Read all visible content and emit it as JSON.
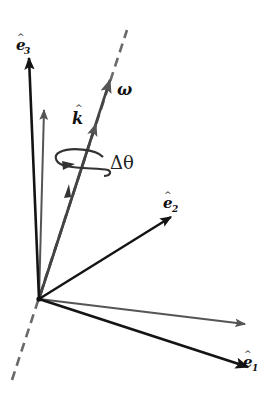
{
  "diagram": {
    "title": "",
    "colors": {
      "background": "#ffffff",
      "basis_vector": "#141414",
      "rotated_vector": "#555555",
      "axis": "#666666"
    },
    "origin": [
      39,
      299
    ],
    "rotation_axis": {
      "style": "dashed",
      "from": [
        12,
        380
      ],
      "to": [
        127,
        30
      ]
    },
    "vectors": [
      {
        "id": "e1",
        "label_base": "e",
        "label_sub": "1",
        "tip": [
          251,
          368
        ],
        "color": "basis",
        "label_pos": [
          250,
          360
        ]
      },
      {
        "id": "e2",
        "label_base": "e",
        "label_sub": "2",
        "tip": [
          173,
          216
        ],
        "color": "basis",
        "label_pos": [
          165,
          200
        ]
      },
      {
        "id": "e3",
        "label_base": "e",
        "label_sub": "3",
        "tip": [
          29,
          55
        ],
        "color": "basis",
        "label_pos": [
          19,
          47
        ]
      },
      {
        "id": "e1-rotated",
        "tip": [
          247,
          324
        ],
        "color": "rotated"
      },
      {
        "id": "e3-rotated",
        "tip": [
          44,
          108
        ],
        "color": "rotated"
      },
      {
        "id": "omega",
        "label": "ω",
        "tip": [
          111,
          78
        ],
        "color": "rotated",
        "label_pos": [
          118,
          94
        ]
      },
      {
        "id": "k-hat",
        "label": "k",
        "tip": [
          97,
          122
        ],
        "color": "rotated",
        "label_pos": [
          72,
          116
        ]
      }
    ],
    "rotation_indicator": {
      "label": "Δθ",
      "center": [
        83,
        160
      ],
      "label_pos": [
        111,
        168
      ]
    },
    "labels": {
      "e1": "e",
      "e1_sub": "1",
      "e2": "e",
      "e2_sub": "2",
      "e3": "e",
      "e3_sub": "3",
      "omega": "ω",
      "k": "k",
      "hat": "^",
      "delta_theta": "Δθ"
    }
  }
}
